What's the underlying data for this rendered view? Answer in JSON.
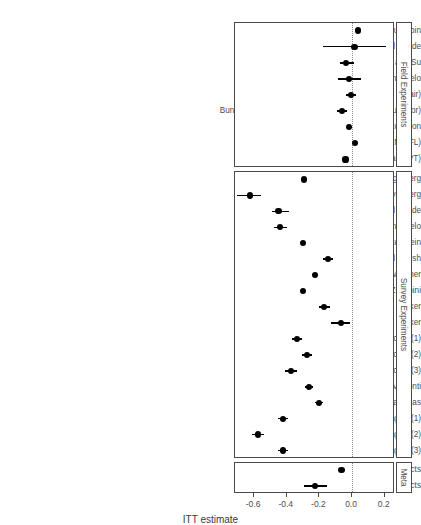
{
  "chart_data": {
    "type": "scatter",
    "plot_kind": "forest-plot",
    "title": "",
    "xlabel": "ITT estimate",
    "ylabel": "",
    "xlim": [
      -0.72,
      0.26
    ],
    "xticks": [
      -0.6,
      -0.4,
      -0.2,
      0.0,
      0.2
    ],
    "xticklabels": [
      "-0.6",
      "-0.4",
      "-0.2",
      "0.0",
      "0.2"
    ],
    "grid": false,
    "reference_line": 0.0,
    "reference_line_style": "dotted",
    "legend": "none",
    "panels": [
      {
        "strip_label": "Field Experiments",
        "rows": [
          {
            "label": "Arias, Larreguy, Marshall, and Querebin",
            "estimate": 0.035,
            "ci_low": 0.035,
            "ci_high": 0.035
          },
          {
            "label": "Banerjee, Green, Green, and Pande",
            "estimate": 0.015,
            "ci_low": -0.175,
            "ci_high": 0.21
          },
          {
            "label": "Banerjee, Kumar, Pande, and Su",
            "estimate": -0.035,
            "ci_low": -0.075,
            "ci_high": 0.015
          },
          {
            "label": "Boas, Hidalgo, and Melo",
            "estimate": -0.02,
            "ci_low": -0.085,
            "ci_high": 0.055
          },
          {
            "label": "Buntaine, Jablonski, Nielson, and Pickering (Chair)",
            "estimate": -0.005,
            "ci_low": -0.035,
            "ci_high": 0.025
          },
          {
            "label": "Buntaine, Jablonski, Nielson, and Pickering (Councillor)",
            "estimate": -0.06,
            "ci_low": -0.09,
            "ci_high": -0.03
          },
          {
            "label": "Chong, De La O,  Karlan, and Wantchekon",
            "estimate": -0.02,
            "ci_low": -0.02,
            "ci_high": -0.02
          },
          {
            "label": "De Figueiredo, Hidalgo, and Kasahara (DEM/PFL)",
            "estimate": 0.02,
            "ci_low": 0.02,
            "ci_high": 0.02
          },
          {
            "label": "De Figueiredo, Hidalgo, and Kasahara (PT)",
            "estimate": -0.04,
            "ci_low": -0.04,
            "ci_high": -0.04
          }
        ]
      },
      {
        "strip_label": "Survey Experiments",
        "rows": [
          {
            "label": "Agerberg",
            "estimate": -0.295,
            "ci_low": -0.295,
            "ci_high": -0.295
          },
          {
            "label": "Avenberg",
            "estimate": -0.625,
            "ci_low": -0.705,
            "ci_high": -0.555
          },
          {
            "label": "Banerjee, Green, McManus, and Pande",
            "estimate": -0.45,
            "ci_low": -0.49,
            "ci_high": -0.385
          },
          {
            "label": "Boas, Hidalgo, and Melo",
            "estimate": -0.44,
            "ci_low": -0.48,
            "ci_high": -0.4
          },
          {
            "label": "Breitenstein",
            "estimate": -0.3,
            "ci_low": -0.3,
            "ci_high": -0.3
          },
          {
            "label": "Chauchard, Klasnja, and Harish",
            "estimate": -0.145,
            "ci_low": -0.175,
            "ci_high": -0.115
          },
          {
            "label": "Eggers, Vivyan, and Wagner",
            "estimate": -0.225,
            "ci_low": -0.225,
            "ci_high": -0.225
          },
          {
            "label": "Franchino and Zucchini",
            "estimate": -0.3,
            "ci_low": -0.3,
            "ci_high": -0.3
          },
          {
            "label": "Klasnja & Tucker",
            "estimate": -0.17,
            "ci_low": -0.205,
            "ci_high": -0.135
          },
          {
            "label": "Klasnja and Tucker",
            "estimate": -0.07,
            "ci_low": -0.13,
            "ci_high": -0.01
          },
          {
            "label": "Klasnja, Lupu, and Tucker (1)",
            "estimate": -0.335,
            "ci_low": -0.365,
            "ci_high": -0.305
          },
          {
            "label": "Klasnja, Lupu, and Tucker (2)",
            "estimate": -0.275,
            "ci_low": -0.305,
            "ci_high": -0.245
          },
          {
            "label": "Klasnja, Lupu, and Tucker (3)",
            "estimate": -0.375,
            "ci_low": -0.41,
            "ci_high": -0.34
          },
          {
            "label": "Mares and Visconti",
            "estimate": -0.265,
            "ci_low": -0.29,
            "ci_high": -0.24
          },
          {
            "label": "Vera Rojas",
            "estimate": -0.2,
            "ci_low": -0.225,
            "ci_high": -0.175
          },
          {
            "label": "Winters and Weitz-Shapiro (1)",
            "estimate": -0.425,
            "ci_low": -0.455,
            "ci_high": -0.395
          },
          {
            "label": "Winters and Weitz-Shapiro (2)",
            "estimate": -0.575,
            "ci_low": -0.61,
            "ci_high": -0.54
          },
          {
            "label": "Winters and Weitz-Shapiro (3)",
            "estimate": -0.425,
            "ci_low": -0.455,
            "ci_high": -0.395
          }
        ]
      },
      {
        "strip_label": "Meta",
        "rows": [
          {
            "label": "Fixed Effects",
            "estimate": -0.065,
            "ci_low": -0.065,
            "ci_high": -0.065
          },
          {
            "label": "Random Effects",
            "estimate": -0.225,
            "ci_low": -0.295,
            "ci_high": -0.155
          }
        ]
      }
    ]
  },
  "colors": {
    "point": "#000000",
    "panel_border": "#4a4a4a",
    "reference_line": "#8a8a8a",
    "text": "#4d4d4d"
  }
}
